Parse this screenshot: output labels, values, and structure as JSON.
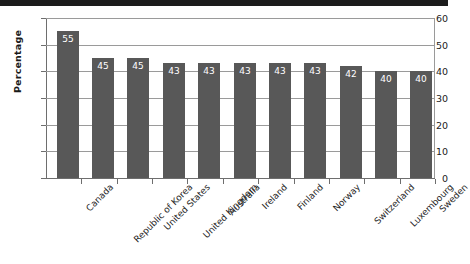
{
  "chart_data": {
    "type": "bar",
    "title": "",
    "subtitle": "",
    "xlabel": "",
    "ylabel": "Percentage",
    "ylim": [
      0,
      60
    ],
    "yticks": [
      0,
      10,
      20,
      30,
      40,
      50,
      60
    ],
    "grid": true,
    "legend": null,
    "bar_color": "#585858",
    "label_color": "#ffffff",
    "categories": [
      "Canada",
      "Republic of Korea",
      "United States",
      "United Kingdom",
      "Australia",
      "Ireland",
      "Finland",
      "Norway",
      "Switzerland",
      "Luxembourg",
      "Sweden"
    ],
    "values": [
      55,
      45,
      45,
      43,
      43,
      43,
      43,
      43,
      42,
      40,
      40
    ],
    "data_labels": [
      "55",
      "45",
      "45",
      "43",
      "43",
      "43",
      "43",
      "43",
      "42",
      "40",
      "40"
    ]
  },
  "axis": {
    "ytick_labels": [
      "60",
      "50",
      "40",
      "30",
      "20",
      "10",
      "0"
    ]
  }
}
